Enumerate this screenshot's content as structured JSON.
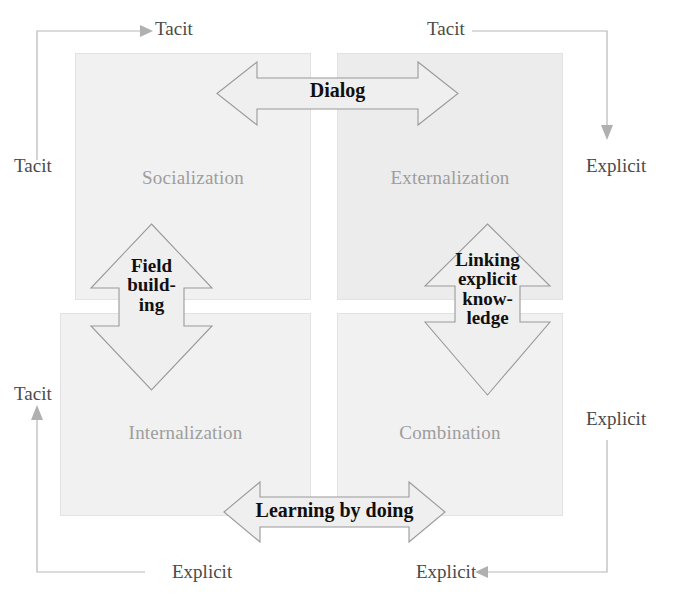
{
  "diagram": {
    "quadrants": [
      {
        "id": "socialization",
        "label": "Socialization",
        "position": "top-left",
        "fill": "#f1f1f1"
      },
      {
        "id": "externalization",
        "label": "Externalization",
        "position": "top-right",
        "fill": "#ececec"
      },
      {
        "id": "internalization",
        "label": "Internalization",
        "position": "bottom-left",
        "fill": "#f1f1f1"
      },
      {
        "id": "combination",
        "label": "Combination",
        "position": "bottom-right",
        "fill": "#f1f1f1"
      }
    ],
    "arrows": [
      {
        "id": "dialog",
        "label": "Dialog",
        "direction": "horizontal-double",
        "between": [
          "socialization",
          "externalization"
        ]
      },
      {
        "id": "field",
        "label": "Field\nbuild-\ning",
        "direction": "vertical-double",
        "between": [
          "socialization",
          "internalization"
        ]
      },
      {
        "id": "linking",
        "label": "Linking\nexplicit\nknow-\nledge",
        "direction": "vertical-double",
        "between": [
          "externalization",
          "combination"
        ]
      },
      {
        "id": "learning",
        "label": "Learning by doing",
        "direction": "horizontal-double",
        "between": [
          "internalization",
          "combination"
        ]
      }
    ],
    "axis_labels": {
      "top_left": "Tacit",
      "top_right": "Tacit",
      "left_top": "Tacit",
      "left_bottom": "Tacit",
      "right_top": "Explicit",
      "right_bottom": "Explicit",
      "bottom_left": "Explicit",
      "bottom_right": "Explicit"
    },
    "colors": {
      "quadrant_fill": "#f1f1f1",
      "quadrant_fill_alt": "#ececec",
      "quadrant_border": "#e2e2e2",
      "quadrant_label_text": "#9d9d9d",
      "arrow_fill": "#efefef",
      "arrow_stroke": "#9a9a9a",
      "arrow_label_text": "#101010",
      "frame_line": "#b7b7b7",
      "axis_label_text": "#4a4a4a",
      "background": "#ffffff"
    }
  }
}
